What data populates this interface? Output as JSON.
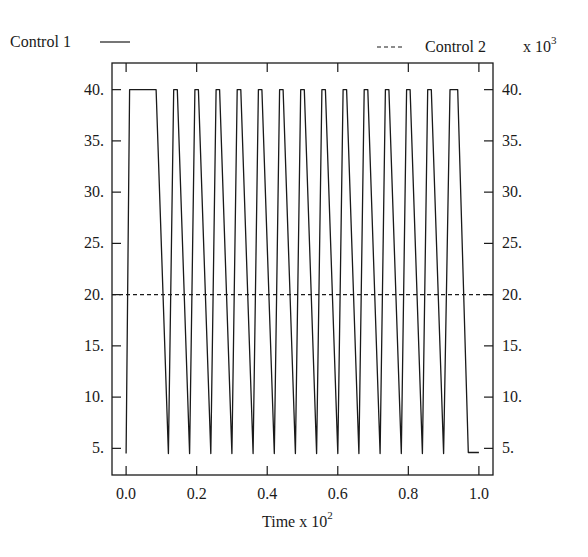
{
  "chart_data": {
    "type": "line",
    "title": "",
    "xlabel": "Time x 10",
    "xlabel_exponent": "2",
    "ylabel_left": "",
    "ylabel_right_multiplier": "x 10",
    "ylabel_right_multiplier_exponent": "3",
    "xlim": [
      -0.04,
      1.04
    ],
    "ylim": [
      2.4,
      42.6
    ],
    "x_ticks": [
      0.0,
      0.2,
      0.4,
      0.6,
      0.8,
      1.0
    ],
    "x_tick_labels": [
      "0.0",
      "0.2",
      "0.4",
      "0.6",
      "0.8",
      "1.0"
    ],
    "y_ticks": [
      5,
      10,
      15,
      20,
      25,
      30,
      35,
      40
    ],
    "y_tick_labels_left": [
      "5.",
      "10.",
      "15.",
      "20.",
      "25.",
      "30.",
      "35.",
      "40."
    ],
    "y_tick_labels_right": [
      "5.",
      "10.",
      "15.",
      "20.",
      "25.",
      "30.",
      "35.",
      "40."
    ],
    "grid": false,
    "legend": {
      "placement": "top",
      "entries": [
        {
          "name": "Control 1",
          "style": "solid",
          "position": "top-left"
        },
        {
          "name": "Control 2",
          "style": "dashed",
          "position": "top-right"
        }
      ]
    },
    "series": [
      {
        "name": "Control 1",
        "style": "solid",
        "axis": "left",
        "x": [
          0.0,
          0.01,
          0.085,
          0.12,
          0.135,
          0.145,
          0.18,
          0.195,
          0.205,
          0.24,
          0.255,
          0.265,
          0.3,
          0.315,
          0.325,
          0.36,
          0.375,
          0.385,
          0.42,
          0.435,
          0.445,
          0.48,
          0.495,
          0.505,
          0.54,
          0.555,
          0.565,
          0.6,
          0.615,
          0.625,
          0.66,
          0.675,
          0.685,
          0.72,
          0.735,
          0.745,
          0.78,
          0.795,
          0.805,
          0.84,
          0.855,
          0.865,
          0.9,
          0.918,
          0.94,
          0.97,
          1.0
        ],
        "y": [
          4.5,
          40,
          40,
          4.5,
          40,
          40,
          4.5,
          40,
          40,
          4.5,
          40,
          40,
          4.5,
          40,
          40,
          4.5,
          40,
          40,
          4.5,
          40,
          40,
          4.5,
          40,
          40,
          4.5,
          40,
          40,
          4.5,
          40,
          40,
          4.5,
          40,
          40,
          4.5,
          40,
          40,
          4.5,
          40,
          40,
          4.5,
          40,
          40,
          4.5,
          40,
          40,
          4.6,
          4.6
        ]
      },
      {
        "name": "Control 2",
        "style": "dashed",
        "axis": "right",
        "x": [
          -0.04,
          1.04
        ],
        "y": [
          20,
          20
        ]
      }
    ]
  }
}
